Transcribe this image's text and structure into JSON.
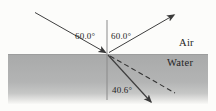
{
  "diagram": {
    "labels": {
      "incident_angle": "60.0°",
      "reflected_angle": "60.0°",
      "refracted_angle": "40.6°",
      "upper_medium": "Air",
      "lower_medium": "Water"
    },
    "colors": {
      "water_gray": "#b3b4b4",
      "ray_stroke": "#3f3f3f",
      "normal_line": "#8a8a8a",
      "text": "#1f1f1f"
    }
  }
}
